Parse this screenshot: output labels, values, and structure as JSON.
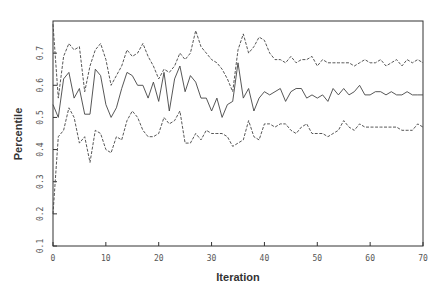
{
  "chart_data": {
    "type": "line",
    "title": "",
    "xlabel": "Iteration",
    "ylabel": "Percentile",
    "xlim": [
      0,
      70
    ],
    "ylim": [
      0.1,
      0.8
    ],
    "xticks": [
      0,
      10,
      20,
      30,
      40,
      50,
      60,
      70
    ],
    "xtick_labels": [
      "0",
      "10",
      "20",
      "30",
      "40",
      "50",
      "60",
      "70"
    ],
    "yticks": [
      0.1,
      0.2,
      0.3,
      0.4,
      0.5,
      0.6,
      0.7
    ],
    "ytick_labels": [
      "0.1",
      "0.2",
      "0.3",
      "0.4",
      "0.5",
      "0.6",
      "0.7"
    ],
    "grid": false,
    "legend": null,
    "x": [
      0,
      1,
      2,
      3,
      4,
      5,
      6,
      7,
      8,
      9,
      10,
      11,
      12,
      13,
      14,
      15,
      16,
      17,
      18,
      19,
      20,
      21,
      22,
      23,
      24,
      25,
      26,
      27,
      28,
      29,
      30,
      31,
      32,
      33,
      34,
      35,
      36,
      37,
      38,
      39,
      40,
      41,
      42,
      43,
      44,
      45,
      46,
      47,
      48,
      49,
      50,
      51,
      52,
      53,
      54,
      55,
      56,
      57,
      58,
      59,
      60,
      61,
      62,
      63,
      64,
      65,
      66,
      67,
      68,
      69,
      70
    ],
    "series": [
      {
        "name": "upper percentile",
        "style": "dashed",
        "values": [
          0.79,
          0.56,
          0.69,
          0.73,
          0.71,
          0.72,
          0.58,
          0.66,
          0.71,
          0.73,
          0.68,
          0.6,
          0.63,
          0.66,
          0.71,
          0.69,
          0.7,
          0.73,
          0.69,
          0.66,
          0.62,
          0.65,
          0.64,
          0.66,
          0.7,
          0.68,
          0.7,
          0.77,
          0.72,
          0.7,
          0.68,
          0.67,
          0.65,
          0.62,
          0.58,
          0.71,
          0.76,
          0.7,
          0.72,
          0.75,
          0.74,
          0.7,
          0.68,
          0.68,
          0.67,
          0.69,
          0.67,
          0.68,
          0.68,
          0.69,
          0.66,
          0.68,
          0.67,
          0.67,
          0.67,
          0.67,
          0.67,
          0.66,
          0.67,
          0.68,
          0.67,
          0.67,
          0.68,
          0.66,
          0.67,
          0.68,
          0.66,
          0.68,
          0.67,
          0.68,
          0.67
        ]
      },
      {
        "name": "median",
        "style": "solid",
        "values": [
          0.54,
          0.5,
          0.62,
          0.64,
          0.56,
          0.59,
          0.51,
          0.51,
          0.65,
          0.63,
          0.54,
          0.5,
          0.53,
          0.59,
          0.64,
          0.63,
          0.6,
          0.6,
          0.56,
          0.61,
          0.55,
          0.64,
          0.52,
          0.62,
          0.66,
          0.58,
          0.63,
          0.61,
          0.56,
          0.56,
          0.52,
          0.56,
          0.5,
          0.54,
          0.55,
          0.67,
          0.56,
          0.59,
          0.52,
          0.56,
          0.58,
          0.57,
          0.58,
          0.59,
          0.55,
          0.58,
          0.59,
          0.59,
          0.56,
          0.57,
          0.56,
          0.57,
          0.55,
          0.59,
          0.57,
          0.59,
          0.57,
          0.58,
          0.6,
          0.57,
          0.57,
          0.58,
          0.58,
          0.57,
          0.58,
          0.57,
          0.57,
          0.58,
          0.57,
          0.57,
          0.57
        ]
      },
      {
        "name": "lower percentile",
        "style": "dashed",
        "values": [
          0.2,
          0.44,
          0.46,
          0.53,
          0.5,
          0.42,
          0.44,
          0.36,
          0.46,
          0.45,
          0.4,
          0.39,
          0.44,
          0.43,
          0.49,
          0.52,
          0.5,
          0.46,
          0.44,
          0.44,
          0.45,
          0.5,
          0.48,
          0.49,
          0.52,
          0.42,
          0.42,
          0.45,
          0.43,
          0.46,
          0.45,
          0.45,
          0.45,
          0.44,
          0.41,
          0.42,
          0.43,
          0.49,
          0.44,
          0.43,
          0.48,
          0.48,
          0.47,
          0.48,
          0.48,
          0.46,
          0.45,
          0.47,
          0.48,
          0.45,
          0.45,
          0.45,
          0.44,
          0.45,
          0.46,
          0.49,
          0.47,
          0.46,
          0.48,
          0.47,
          0.47,
          0.47,
          0.47,
          0.47,
          0.47,
          0.47,
          0.46,
          0.46,
          0.46,
          0.48,
          0.47
        ]
      }
    ],
    "colors": {
      "line": "#444444",
      "axis": "#333333",
      "text": "#555555",
      "background": "#ffffff"
    }
  }
}
